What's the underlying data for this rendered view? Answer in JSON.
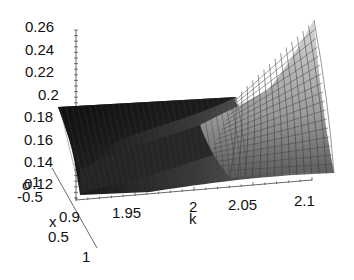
{
  "chart_data": {
    "type": "surface3d",
    "title": "",
    "axes": {
      "z": {
        "label": "",
        "ticks": [
          "0.26",
          "0.24",
          "0.22",
          "0.2",
          "0.18",
          "0.16",
          "0.14",
          "0.12"
        ],
        "range": [
          0.12,
          0.26
        ]
      },
      "k": {
        "label": "k",
        "ticks": [
          "1.95",
          "2",
          "2.05",
          "2.1"
        ],
        "range": [
          1.9,
          2.1
        ]
      },
      "sigma": {
        "label": "σ",
        "ticks": [
          "-1",
          "-0.5",
          "0",
          "0.5",
          "1"
        ],
        "range": [
          -1,
          1
        ]
      },
      "x_label": "x"
    },
    "surface": {
      "description": "Mesh surface; dark left region near z≈0.19 at k=1.9, rising to a light-shaded sheet peaking near z≈0.26 at k=2.1",
      "corner_values": [
        {
          "k": 1.9,
          "sigma": -1,
          "z": 0.19
        },
        {
          "k": 2.1,
          "sigma": -1,
          "z": 0.26
        },
        {
          "k": 1.9,
          "sigma": 1,
          "z": 0.12
        },
        {
          "k": 2.1,
          "sigma": 1,
          "z": 0.14
        }
      ]
    },
    "grid": false,
    "legend": null
  },
  "labels": {
    "z_ticks": [
      "0.26",
      "0.24",
      "0.22",
      "0.2",
      "0.18",
      "0.16",
      "0.14",
      "0.12"
    ],
    "k_ticks": [
      "1.95",
      "2",
      "2.05",
      "2.1"
    ],
    "k_title": "k",
    "sigma_ticks": [
      "1",
      "-0.5",
      "0.9",
      "0.5",
      "1"
    ],
    "sigma_title": "σ",
    "x_title": "x"
  },
  "colors": {
    "dark_surface": "#151515",
    "light_surface": "#cfcfcf",
    "mesh_line": "#2a2a2a",
    "axis": "#333333"
  }
}
